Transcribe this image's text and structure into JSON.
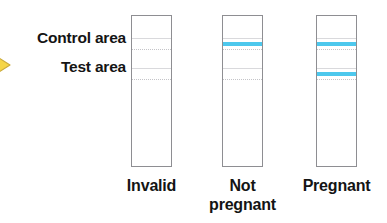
{
  "figure": {
    "marker_icon": "yellow-arrow-icon",
    "marker_color": "#F5D547"
  },
  "labels": {
    "control": "Control area",
    "test": "Test area"
  },
  "colors": {
    "result_line": "#4DC8ED",
    "strip_border": "#8E8E92",
    "guide_line": "#D9D9DC",
    "text": "#141414"
  },
  "strips": [
    {
      "id": "strip-invalid",
      "caption": "Invalid",
      "control_line": false,
      "test_line": false
    },
    {
      "id": "strip-not-pregnant",
      "caption": "Not\npregnant",
      "caption_line1": "Not",
      "caption_line2": "pregnant",
      "control_line": true,
      "test_line": false
    },
    {
      "id": "strip-pregnant",
      "caption": "Pregnant",
      "caption_line1": "Pregnant",
      "caption_line2": "",
      "control_line": true,
      "test_line": true
    }
  ]
}
